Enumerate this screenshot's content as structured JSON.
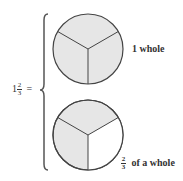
{
  "equation": {
    "whole": "1",
    "numerator": "2",
    "denominator": "3",
    "equals": "="
  },
  "circles": [
    {
      "name": "top",
      "parts": 3,
      "shaded": 3,
      "label": "1 whole"
    },
    {
      "name": "bottom",
      "parts": 3,
      "shaded": 2,
      "label_numerator": "2",
      "label_denominator": "3",
      "label_text": "of a whole"
    }
  ],
  "colors": {
    "shade": "#e6e6e6",
    "stroke": "#444444",
    "background": "#ffffff"
  }
}
